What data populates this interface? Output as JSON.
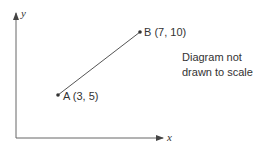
{
  "diagram": {
    "axes": {
      "x_label": "x",
      "y_label": "y"
    },
    "points": [
      {
        "name": "A",
        "label": "A (3, 5)",
        "x": 3,
        "y": 5
      },
      {
        "name": "B",
        "label": "B (7, 10)",
        "x": 7,
        "y": 10
      }
    ],
    "note": {
      "line1": "Diagram not",
      "line2": "drawn to scale"
    },
    "colors": {
      "line": "#555555",
      "text": "#333333"
    }
  }
}
